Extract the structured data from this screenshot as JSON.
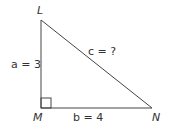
{
  "diagram": {
    "type": "right-triangle",
    "vertices": {
      "L": {
        "label": "L"
      },
      "M": {
        "label": "M"
      },
      "N": {
        "label": "N"
      }
    },
    "sides": {
      "a": {
        "label": "a = 3"
      },
      "b": {
        "label": "b = 4"
      },
      "c": {
        "label": "c = ?"
      }
    },
    "right_angle_at": "M",
    "stroke_color": "#444444"
  }
}
